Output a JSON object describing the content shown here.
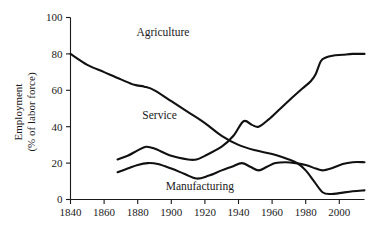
{
  "chart_data": {
    "type": "line",
    "title": "",
    "xlabel": "",
    "ylabel": "Employment\n(% of labor force)",
    "ylabel_line1": "Employment",
    "ylabel_line2": "(% of labor force)",
    "xlim": [
      1840,
      2015
    ],
    "ylim": [
      0,
      100
    ],
    "grid": false,
    "legend_position": "inline-annotations",
    "xticks": [
      1840,
      1860,
      1880,
      1900,
      1920,
      1940,
      1960,
      1980,
      2000
    ],
    "xtick_labels": [
      "1840",
      "1860",
      "1880",
      "1900",
      "1920",
      "1940",
      "1960",
      "1980",
      "2000"
    ],
    "yticks": [
      0,
      20,
      40,
      60,
      80,
      100
    ],
    "ytick_labels": [
      "0",
      "20",
      "40",
      "60",
      "80",
      "100"
    ],
    "annotations": [
      {
        "text": "Agriculture",
        "x": 1895,
        "y": 90
      },
      {
        "text": "Service",
        "x": 1893,
        "y": 44
      },
      {
        "text": "Manufacturing",
        "x": 1917,
        "y": 5
      }
    ],
    "series": [
      {
        "name": "Agriculture",
        "color": "#111111",
        "x": [
          1840,
          1850,
          1860,
          1870,
          1878,
          1884,
          1890,
          1900,
          1910,
          1920,
          1930,
          1940,
          1950,
          1960,
          1970,
          1975,
          1980,
          1985,
          1990,
          1995,
          2000,
          2008,
          2015
        ],
        "y": [
          80,
          74,
          70,
          66,
          63,
          62,
          60,
          54,
          48,
          42,
          35,
          30,
          27,
          25,
          22,
          20,
          16,
          10,
          4,
          3,
          3.5,
          4.5,
          5
        ]
      },
      {
        "name": "Service",
        "color": "#111111",
        "x": [
          1868,
          1874,
          1880,
          1885,
          1890,
          1900,
          1910,
          1915,
          1920,
          1930,
          1937,
          1943,
          1948,
          1952,
          1958,
          1965,
          1972,
          1978,
          1983,
          1986,
          1989,
          1992,
          1996,
          2002,
          2008,
          2015
        ],
        "y": [
          22,
          24,
          27,
          29,
          28,
          24,
          22,
          22,
          24,
          29,
          35,
          43,
          41,
          40,
          44,
          50,
          56,
          61,
          65,
          69,
          76,
          78,
          79,
          79.5,
          80,
          80
        ]
      },
      {
        "name": "Manufacturing",
        "color": "#111111",
        "x": [
          1868,
          1874,
          1880,
          1886,
          1892,
          1900,
          1908,
          1915,
          1922,
          1930,
          1936,
          1942,
          1947,
          1952,
          1957,
          1962,
          1968,
          1974,
          1980,
          1986,
          1990,
          1995,
          2002,
          2008,
          2015
        ],
        "y": [
          15,
          17,
          19,
          20,
          19.5,
          17,
          14,
          11.5,
          13,
          16,
          18,
          20,
          18,
          16,
          18,
          20,
          20.5,
          20,
          19,
          17,
          16,
          17,
          19.5,
          20.5,
          20.5
        ]
      }
    ]
  },
  "axis": {
    "y_title_line1": "Employment",
    "y_title_line2": "(% of labor force)"
  }
}
